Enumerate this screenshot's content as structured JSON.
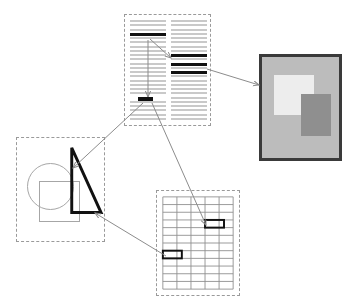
{
  "diagram": {
    "background_color": "#ffffff",
    "width": 360,
    "height": 307,
    "panel_border_color": "#9a9a9a",
    "panel_border_style": "dashed"
  },
  "panels": {
    "document": {
      "name": "text-document-panel",
      "x": 124,
      "y": 14,
      "width": 87,
      "height": 112,
      "columns": 2,
      "line_color": "#c9c9c9",
      "highlight_color": "#111111",
      "left_column": {
        "total_lines": 24,
        "highlighted_line_indexes": [
          3
        ],
        "marker_line_index": 18
      },
      "right_column": {
        "total_lines": 24,
        "highlighted_line_indexes": [
          8,
          10,
          12
        ]
      }
    },
    "image": {
      "name": "photo-image-panel",
      "x": 259,
      "y": 54,
      "width": 83,
      "height": 107,
      "frame_color": "#3a3a3a",
      "frame_width": 3,
      "background_color": "#bcbcbc",
      "regions": [
        {
          "label": "light-region",
          "color": "#ededed",
          "x": 12,
          "y": 18,
          "width": 40,
          "height": 40
        },
        {
          "label": "dark-region",
          "color": "#8f8f8f",
          "x": 39,
          "y": 37,
          "width": 30,
          "height": 42
        }
      ]
    },
    "shapes": {
      "name": "vector-shapes-panel",
      "x": 16,
      "y": 137,
      "width": 89,
      "height": 105,
      "items": [
        {
          "label": "circle",
          "stroke": "#a6a6a6",
          "stroke_width": 1
        },
        {
          "label": "square",
          "stroke": "#a6a6a6",
          "stroke_width": 1
        },
        {
          "label": "triangle",
          "stroke": "#111111",
          "stroke_width": 3
        }
      ],
      "triangle_points": "56,10 56,76 86,76"
    },
    "grid": {
      "name": "data-grid-panel",
      "x": 156,
      "y": 190,
      "width": 84,
      "height": 106,
      "rows": 12,
      "columns": 5,
      "line_color": "#8e8e8e",
      "highlight_color": "#111111",
      "highlighted_cells": [
        {
          "label": "cell-upper",
          "row": 3,
          "col": 3
        },
        {
          "label": "cell-lower",
          "row": 7,
          "col": 0
        }
      ]
    }
  },
  "arrows": {
    "stroke": "#8c8c8c",
    "stroke_width": 1,
    "links": [
      {
        "name": "doc-left-to-doc-right",
        "from": "document.left_column.highlight",
        "to": "document.right_column.highlight",
        "x1": 150,
        "y1": 39,
        "x2": 171,
        "y2": 58
      },
      {
        "name": "doc-left-to-doc-marker",
        "from": "document.left_column.highlight",
        "to": "document.marker",
        "x1": 148,
        "y1": 40,
        "x2": 148,
        "y2": 97
      },
      {
        "name": "doc-right-to-image",
        "from": "document.right_column.highlight",
        "to": "image",
        "x1": 207,
        "y1": 69,
        "x2": 259,
        "y2": 85
      },
      {
        "name": "doc-marker-to-shapes",
        "from": "document.marker",
        "to": "shapes.triangle",
        "x1": 143,
        "y1": 103,
        "x2": 73,
        "y2": 168
      },
      {
        "name": "doc-marker-to-grid",
        "from": "document.marker",
        "to": "grid.cell-upper",
        "x1": 152,
        "y1": 103,
        "x2": 206,
        "y2": 225
      },
      {
        "name": "grid-to-shapes",
        "from": "grid.cell-lower",
        "to": "shapes.triangle",
        "x1": 166,
        "y1": 256,
        "x2": 95,
        "y2": 213
      }
    ]
  }
}
